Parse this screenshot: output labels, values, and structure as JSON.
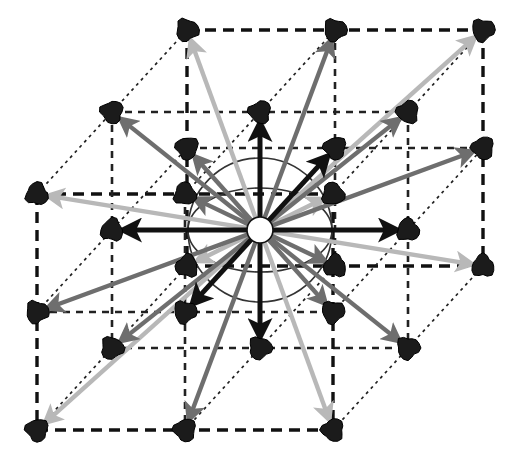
{
  "figure": {
    "title": "",
    "type": "crystal-lattice-neighbor-vector-diagram",
    "canvas": {
      "width": 519,
      "height": 462
    },
    "background_color": "#ffffff"
  },
  "colors": {
    "node_fill": "#1b1b1b",
    "node_stroke": "#000000",
    "origin_fill": "#ffffff",
    "origin_stroke": "#111111",
    "shell_1": "#111111",
    "shell_2": "#6e6e6e",
    "shell_3": "#b8b8b8",
    "cell_edge_outer": "#111111",
    "cell_edge_inner": "#222222",
    "sphere_guide": "#333333"
  },
  "projection": {
    "origin": {
      "x": 260,
      "y": 230
    },
    "axis_a": {
      "label": "a (right)",
      "dx": 148,
      "dy": 0
    },
    "axis_b": {
      "label": "b (up)",
      "dx": 0,
      "dy": -118
    },
    "axis_c": {
      "label": "c (depth)",
      "dx": 75,
      "dy": -82
    }
  },
  "nodes": [
    {
      "id": "n_-1_1_-1",
      "i": -1,
      "j": 1,
      "k": -1,
      "x": 37,
      "y": 194,
      "shell": 3
    },
    {
      "id": "n_0_1_-1",
      "i": 0,
      "j": 1,
      "k": -1,
      "x": 185,
      "y": 194,
      "shell": 2
    },
    {
      "id": "n_1_1_-1",
      "i": 1,
      "j": 1,
      "k": -1,
      "x": 333,
      "y": 194,
      "shell": 3
    },
    {
      "id": "n_-1_1_0",
      "i": -1,
      "j": 1,
      "k": 0,
      "x": 112,
      "y": 112,
      "shell": 2
    },
    {
      "id": "n_0_1_0",
      "i": 0,
      "j": 1,
      "k": 0,
      "x": 260,
      "y": 112,
      "shell": 1
    },
    {
      "id": "n_1_1_0",
      "i": 1,
      "j": 1,
      "k": 0,
      "x": 408,
      "y": 112,
      "shell": 2
    },
    {
      "id": "n_-1_1_1",
      "i": -1,
      "j": 1,
      "k": 1,
      "x": 187,
      "y": 30,
      "shell": 3
    },
    {
      "id": "n_0_1_1",
      "i": 0,
      "j": 1,
      "k": 1,
      "x": 335,
      "y": 30,
      "shell": 2
    },
    {
      "id": "n_1_1_1",
      "i": 1,
      "j": 1,
      "k": 1,
      "x": 483,
      "y": 30,
      "shell": 3
    },
    {
      "id": "n_-1_0_-1",
      "i": -1,
      "j": 0,
      "k": -1,
      "x": 37,
      "y": 312,
      "shell": 2
    },
    {
      "id": "n_0_0_-1",
      "i": 0,
      "j": 0,
      "k": -1,
      "x": 185,
      "y": 312,
      "shell": 1
    },
    {
      "id": "n_1_0_-1",
      "i": 1,
      "j": 0,
      "k": -1,
      "x": 333,
      "y": 312,
      "shell": 2
    },
    {
      "id": "n_-1_0_0",
      "i": -1,
      "j": 0,
      "k": 0,
      "x": 112,
      "y": 230,
      "shell": 1
    },
    {
      "id": "n_1_0_0",
      "i": 1,
      "j": 0,
      "k": 0,
      "x": 408,
      "y": 230,
      "shell": 1
    },
    {
      "id": "n_-1_0_1",
      "i": -1,
      "j": 0,
      "k": 1,
      "x": 187,
      "y": 148,
      "shell": 2
    },
    {
      "id": "n_0_0_1",
      "i": 0,
      "j": 0,
      "k": 1,
      "x": 335,
      "y": 148,
      "shell": 1
    },
    {
      "id": "n_1_0_1",
      "i": 1,
      "j": 0,
      "k": 1,
      "x": 483,
      "y": 148,
      "shell": 2
    },
    {
      "id": "n_-1_-1_-1",
      "i": -1,
      "j": -1,
      "k": -1,
      "x": 37,
      "y": 430,
      "shell": 3
    },
    {
      "id": "n_0_-1_-1",
      "i": 0,
      "j": -1,
      "k": -1,
      "x": 185,
      "y": 430,
      "shell": 2
    },
    {
      "id": "n_1_-1_-1",
      "i": 1,
      "j": -1,
      "k": -1,
      "x": 333,
      "y": 430,
      "shell": 3
    },
    {
      "id": "n_-1_-1_0",
      "i": -1,
      "j": -1,
      "k": 0,
      "x": 112,
      "y": 348,
      "shell": 2
    },
    {
      "id": "n_0_-1_0",
      "i": 0,
      "j": -1,
      "k": 0,
      "x": 260,
      "y": 348,
      "shell": 1
    },
    {
      "id": "n_1_-1_0",
      "i": 1,
      "j": -1,
      "k": 0,
      "x": 408,
      "y": 348,
      "shell": 2
    },
    {
      "id": "n_-1_-1_1",
      "i": -1,
      "j": -1,
      "k": 1,
      "x": 187,
      "y": 266,
      "shell": 3
    },
    {
      "id": "n_0_-1_1",
      "i": 0,
      "j": -1,
      "k": 1,
      "x": 335,
      "y": 266,
      "shell": 2
    },
    {
      "id": "n_1_-1_1",
      "i": 1,
      "j": -1,
      "k": 1,
      "x": 483,
      "y": 266,
      "shell": 3
    }
  ],
  "origin_node": {
    "id": "n_0_0_0",
    "x": 260,
    "y": 230,
    "radius": 13,
    "label": ""
  },
  "node_radius": 11,
  "guides": {
    "circle": {
      "cx": 260,
      "cy": 230,
      "r": 72
    },
    "ellipse": {
      "cx": 260,
      "cy": 230,
      "rx": 72,
      "ry": 42
    }
  },
  "cell_outline": {
    "outer_face_front": [
      {
        "x": 37,
        "y": 194
      },
      {
        "x": 333,
        "y": 194
      },
      {
        "x": 333,
        "y": 430
      },
      {
        "x": 37,
        "y": 430
      }
    ],
    "outer_face_back": [
      {
        "x": 187,
        "y": 30
      },
      {
        "x": 483,
        "y": 30
      },
      {
        "x": 483,
        "y": 266
      },
      {
        "x": 187,
        "y": 266
      }
    ]
  },
  "legend": {
    "shells": [
      {
        "name": "axial nearest neighbours",
        "color": "#111111"
      },
      {
        "name": "face-diagonal neighbours",
        "color": "#6e6e6e"
      },
      {
        "name": "body-diagonal neighbours",
        "color": "#b8b8b8"
      }
    ]
  }
}
